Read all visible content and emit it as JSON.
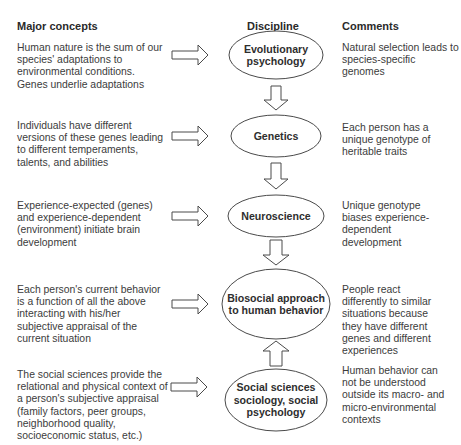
{
  "headers": {
    "concepts": "Major concepts",
    "discipline": "Discipline",
    "comments": "Comments"
  },
  "rows": [
    {
      "concept": "Human nature is the sum of our species' adaptations to environmental conditions. Genes underlie adaptations",
      "discipline": "Evolutionary psychology",
      "comment": "Natural selection leads to species-specific genomes"
    },
    {
      "concept": "Individuals have different versions of these genes leading to different temperaments, talents, and abilities",
      "discipline": "Genetics",
      "comment": "Each person has a unique genotype of heritable traits"
    },
    {
      "concept": "Experience-expected (genes) and experience-dependent (environment) initiate brain development",
      "discipline": "Neuroscience",
      "comment": "Unique genotype biases experience-dependent development"
    },
    {
      "concept": "Each person's current behavior is a function of all the above interacting with his/her subjective appraisal of the current situation",
      "discipline": "Biosocial approach to human behavior",
      "comment": "People react differently to similar situations because they have different genes and different experiences"
    },
    {
      "concept": "The social sciences provide the relational and physical context of a person's subjective appraisal (family factors, peer groups, neighborhood quality, socioeconomic status, etc.)",
      "discipline": "Social sciences sociology, social psychology",
      "comment": "Human behavior can not be understood outside its macro- and micro-environmental contexts"
    }
  ],
  "arrows": {
    "right": "concept-to-discipline",
    "down": [
      "Evolutionary psychology→Genetics",
      "Genetics→Neuroscience",
      "Neuroscience→Biosocial"
    ],
    "up": [
      "Social sciences→Biosocial"
    ]
  },
  "colors": {
    "stroke": "#4a4a4a",
    "text": "#3c3c3c",
    "background": "#ffffff"
  }
}
